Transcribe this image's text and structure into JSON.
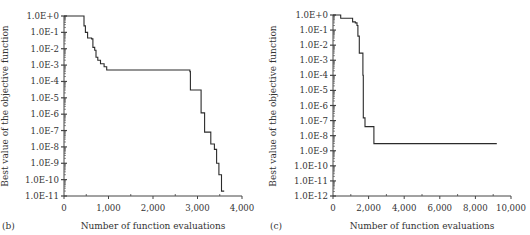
{
  "chart_data": [
    {
      "panel": "(b)",
      "type": "line",
      "title": "",
      "xlabel": "Number of function evaluations",
      "ylabel": "Best value of the objective function",
      "yscale": "log",
      "xlim": [
        0,
        4000
      ],
      "ylim": [
        1e-11,
        1
      ],
      "x_ticks": [
        "0",
        "1,000",
        "2,000",
        "3,000",
        "4,000"
      ],
      "y_ticks": [
        "1.0E+0",
        "1.0E-1",
        "1.0E-2",
        "1.0E-3",
        "1.0E-4",
        "1.0E-5",
        "1.0E-6",
        "1.0E-7",
        "1.0E-8",
        "1.0E-9",
        "1.0E-10",
        "1.0E-11"
      ],
      "grid": false,
      "legend": null,
      "series": [
        {
          "name": "best value",
          "step": true,
          "points": [
            [
              0,
              1.0
            ],
            [
              420,
              1.0
            ],
            [
              450,
              0.25
            ],
            [
              480,
              0.1
            ],
            [
              530,
              0.045
            ],
            [
              620,
              0.04
            ],
            [
              650,
              0.012
            ],
            [
              690,
              0.008
            ],
            [
              720,
              0.003
            ],
            [
              760,
              0.002
            ],
            [
              820,
              0.0012
            ],
            [
              900,
              0.0008
            ],
            [
              960,
              0.0005
            ],
            [
              2780,
              0.0005
            ],
            [
              2830,
              0.0004
            ],
            [
              2840,
              3e-05
            ],
            [
              3070,
              3e-05
            ],
            [
              3080,
              1.2e-06
            ],
            [
              3150,
              1.2e-06
            ],
            [
              3160,
              8e-08
            ],
            [
              3260,
              8e-08
            ],
            [
              3300,
              1.5e-08
            ],
            [
              3380,
              7e-09
            ],
            [
              3430,
              1e-09
            ],
            [
              3480,
              2e-10
            ],
            [
              3540,
              2e-11
            ],
            [
              3600,
              2e-11
            ]
          ]
        }
      ]
    },
    {
      "panel": "(c)",
      "type": "line",
      "title": "",
      "xlabel": "Number of function evaluations",
      "ylabel": "Best value of the objective function",
      "yscale": "log",
      "xlim": [
        0,
        10000
      ],
      "ylim": [
        1e-12,
        1
      ],
      "x_ticks": [
        "0",
        "2,000",
        "4,000",
        "6,000",
        "8,000",
        "10,000"
      ],
      "y_ticks": [
        "1.0E+0",
        "1.0E-1",
        "1.0E-2",
        "1.0E-3",
        "1.0E-4",
        "1.0E-5",
        "1.0E-6",
        "1.0E-7",
        "1.0E-8",
        "1.0E-9",
        "1.0E-10",
        "1.0E-11",
        "1.0E-12"
      ],
      "grid": false,
      "legend": null,
      "series": [
        {
          "name": "best value",
          "step": true,
          "points": [
            [
              0,
              1.0
            ],
            [
              430,
              1.0
            ],
            [
              430,
              0.6
            ],
            [
              1050,
              0.6
            ],
            [
              1100,
              0.35
            ],
            [
              1250,
              0.3
            ],
            [
              1350,
              0.2
            ],
            [
              1400,
              0.04
            ],
            [
              1480,
              0.003
            ],
            [
              1650,
              0.003
            ],
            [
              1680,
              0.0001
            ],
            [
              1700,
              1.5e-07
            ],
            [
              1800,
              4e-08
            ],
            [
              2300,
              4e-08
            ],
            [
              2300,
              3e-09
            ],
            [
              9200,
              3e-09
            ]
          ]
        }
      ]
    }
  ],
  "panels": {
    "b": {
      "label": "(b)",
      "xlabel": "Number of function evaluations",
      "ylabel": "Best value of the objective function"
    },
    "c": {
      "label": "(c)",
      "xlabel": "Number of function evaluations",
      "ylabel": "Best value of the objective function"
    }
  },
  "colors": {
    "line": "#2b2b2b",
    "axis": "#444444",
    "text": "#333333"
  }
}
